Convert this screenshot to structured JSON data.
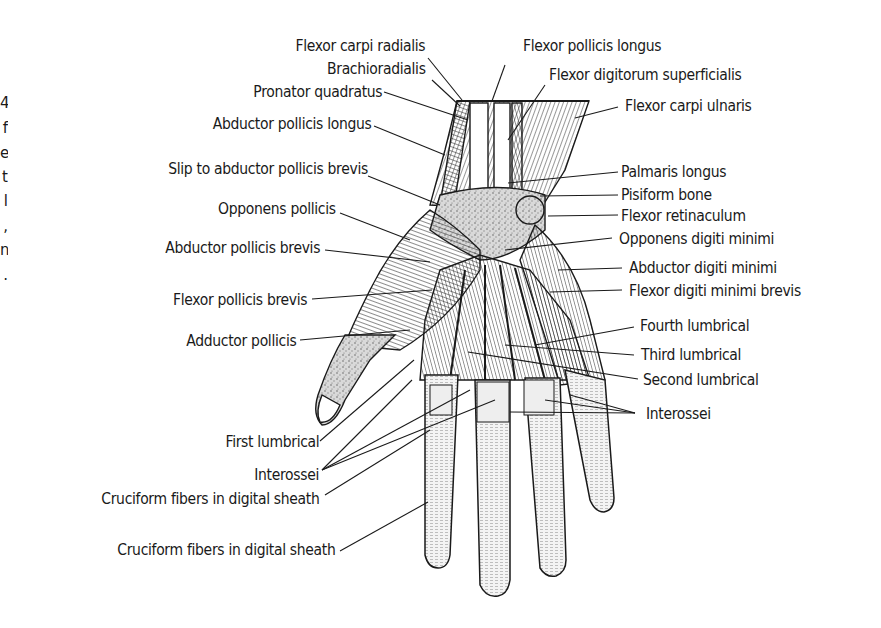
{
  "figure": {
    "colors": {
      "ink": "#1a1a1a",
      "background": "#ffffff",
      "stipple": "#8a8a8a"
    }
  },
  "margin_fragments": [
    "4",
    "f",
    "e",
    "t",
    "l",
    ",",
    "n",
    "."
  ],
  "labels_left": [
    {
      "id": "flexor-carpi-radialis",
      "text": "Flexor carpi radialis"
    },
    {
      "id": "brachioradialis",
      "text": "Brachioradialis"
    },
    {
      "id": "pronator-quadratus",
      "text": "Pronator quadratus"
    },
    {
      "id": "abductor-pollicis-longus",
      "text": "Abductor pollicis longus"
    },
    {
      "id": "slip-to-abductor-pollicis-brevis",
      "text": "Slip to abductor pollicis brevis"
    },
    {
      "id": "opponens-pollicis",
      "text": "Opponens pollicis"
    },
    {
      "id": "abductor-pollicis-brevis",
      "text": "Abductor pollicis brevis"
    },
    {
      "id": "flexor-pollicis-brevis",
      "text": "Flexor pollicis brevis"
    },
    {
      "id": "adductor-pollicis",
      "text": "Adductor pollicis"
    },
    {
      "id": "first-lumbrical",
      "text": "First lumbrical"
    },
    {
      "id": "interossei-left",
      "text": "Interossei"
    },
    {
      "id": "cruciform-fibers-1",
      "text": "Cruciform fibers in digital sheath"
    },
    {
      "id": "cruciform-fibers-2",
      "text": "Cruciform fibers in digital sheath"
    }
  ],
  "labels_right": [
    {
      "id": "flexor-pollicis-longus",
      "text": "Flexor pollicis longus"
    },
    {
      "id": "flexor-digitorum-superficialis",
      "text": "Flexor digitorum superficialis"
    },
    {
      "id": "flexor-carpi-ulnaris",
      "text": "Flexor carpi ulnaris"
    },
    {
      "id": "palmaris-longus",
      "text": "Palmaris longus"
    },
    {
      "id": "pisiform-bone",
      "text": "Pisiform bone"
    },
    {
      "id": "flexor-retinaculum",
      "text": "Flexor retinaculum"
    },
    {
      "id": "opponens-digiti-minimi",
      "text": "Opponens digiti minimi"
    },
    {
      "id": "abductor-digiti-minimi",
      "text": "Abductor digiti minimi"
    },
    {
      "id": "flexor-digiti-minimi-brevis",
      "text": "Flexor digiti minimi brevis"
    },
    {
      "id": "fourth-lumbrical",
      "text": "Fourth lumbrical"
    },
    {
      "id": "third-lumbrical",
      "text": "Third lumbrical"
    },
    {
      "id": "second-lumbrical",
      "text": "Second lumbrical"
    },
    {
      "id": "interossei-right",
      "text": "Interossei"
    }
  ]
}
